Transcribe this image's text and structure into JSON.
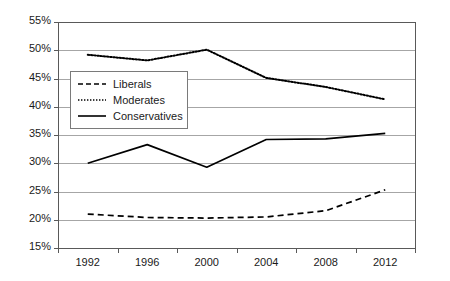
{
  "chart_data": {
    "type": "line",
    "title": "",
    "subtitle": "",
    "xlabel": "",
    "ylabel": "",
    "categories": [
      "1992",
      "1996",
      "2000",
      "2004",
      "2008",
      "2012"
    ],
    "x": [
      1992,
      1996,
      2000,
      2004,
      2008,
      2012
    ],
    "ylim": [
      15,
      55
    ],
    "xlim_categories": true,
    "grid": "horizontal",
    "y_tick_labels": [
      "15%",
      "20%",
      "25%",
      "30%",
      "35%",
      "40%",
      "45%",
      "50%",
      "55%"
    ],
    "y_tick_values": [
      15,
      20,
      25,
      30,
      35,
      40,
      45,
      50,
      55
    ],
    "y_tick_step": 5,
    "value_suffix": "%",
    "legend_position": "inside-upper-left",
    "series": [
      {
        "name": "Liberals",
        "line_style": "dashed",
        "color": "#000000",
        "values": [
          21.0,
          20.4,
          20.3,
          20.5,
          21.6,
          25.3
        ]
      },
      {
        "name": "Moderates",
        "line_style": "dotted",
        "color": "#000000",
        "values": [
          49.2,
          48.2,
          50.1,
          45.1,
          43.5,
          41.3
        ]
      },
      {
        "name": "Conservatives",
        "line_style": "solid",
        "color": "#000000",
        "values": [
          30.0,
          33.3,
          29.3,
          34.2,
          34.3,
          35.3
        ]
      }
    ]
  },
  "axis": {
    "frame_color": "#595959",
    "gridline_color": "#a6a6a6",
    "tick_color": "#595959"
  }
}
